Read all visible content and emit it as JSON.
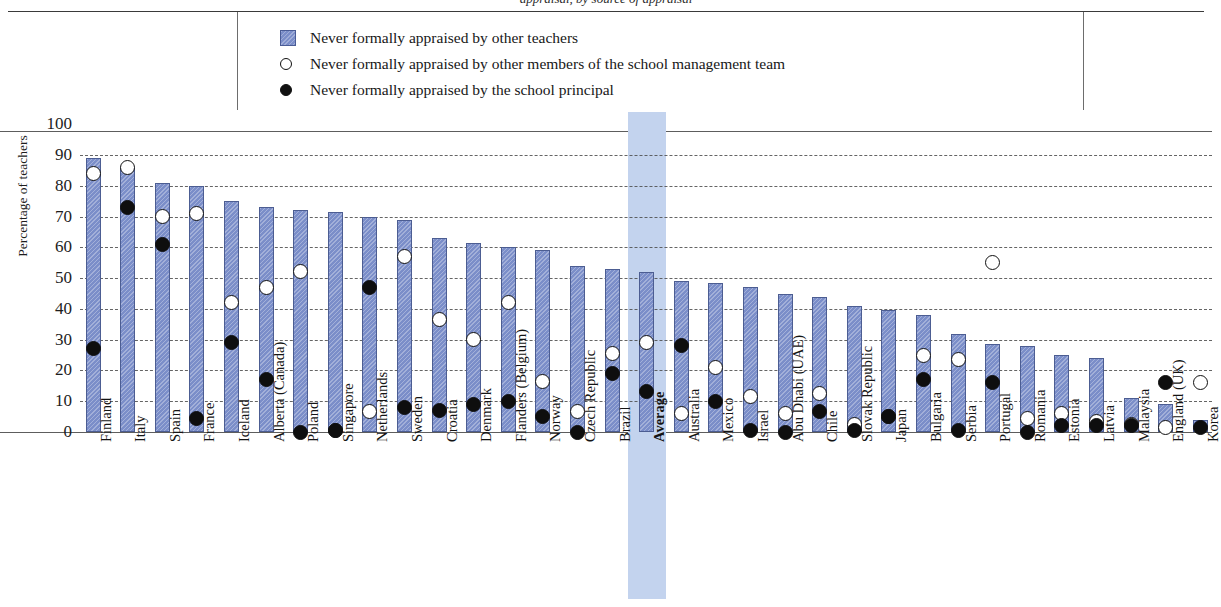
{
  "figure": {
    "partial_title_fragment": "appraisal, by source of appraisal",
    "y_axis_label": "Percentage of teachers",
    "highlight_category": "Average"
  },
  "legend": {
    "position": "top-center",
    "items": [
      {
        "marker": "bar-swatch-icon",
        "label": "Never formally appraised by other teachers"
      },
      {
        "marker": "open-circle-icon",
        "label": "Never formally appraised by other members of the school management team"
      },
      {
        "marker": "filled-circle-icon",
        "label": "Never formally appraised by the school principal"
      }
    ]
  },
  "colors": {
    "bar": "#7b8ec9",
    "bar_border": "#4c5d92",
    "highlight_band": "#c3d3ee",
    "marker_open_fill": "#ffffff",
    "marker_filled_fill": "#0e0e0e",
    "grid": "#4b4b4b",
    "axis": "#5d5d5d"
  },
  "chart_data": {
    "type": "bar",
    "title": "",
    "xlabel": "",
    "ylabel": "Percentage of teachers",
    "ylim": [
      0,
      100
    ],
    "yticks": [
      0,
      10,
      20,
      30,
      40,
      50,
      60,
      70,
      80,
      90,
      100
    ],
    "grid": true,
    "legend_position": "top",
    "categories": [
      "Finland",
      "Italy",
      "Spain",
      "France",
      "Iceland",
      "Alberta (Canada)",
      "Poland",
      "Singapore",
      "Netherlands",
      "Sweden",
      "Croatia",
      "Denmark",
      "Flanders (Belgium)",
      "Norway",
      "Czech Republic",
      "Brazil",
      "Average",
      "Australia",
      "Mexico",
      "Israel",
      "Abu Dhabi (UAE)",
      "Chile",
      "Slovak Republic",
      "Japan",
      "Bulgaria",
      "Serbia",
      "Portugal",
      "Romania",
      "Estonia",
      "Latvia",
      "Malaysia",
      "England (UK)",
      "Korea"
    ],
    "series": [
      {
        "name": "Never formally appraised by other teachers",
        "type": "bar",
        "values": [
          89,
          86,
          81,
          80,
          75,
          73,
          72,
          71.5,
          70,
          69,
          63,
          61.5,
          60,
          59,
          54,
          53,
          52,
          49,
          48.5,
          47,
          45,
          44,
          41,
          39.5,
          38,
          32,
          28.5,
          28,
          25,
          24,
          11,
          9,
          4
        ]
      },
      {
        "name": "Never formally appraised by other members of the school management team",
        "type": "marker-open",
        "values": [
          84,
          86,
          70,
          71,
          42,
          47,
          52,
          0.5,
          6.5,
          57,
          36.5,
          30,
          42,
          16.5,
          6.5,
          25.5,
          29,
          6,
          21,
          11.5,
          6,
          12.5,
          2.5,
          5,
          25,
          23.5,
          55,
          4.5,
          6,
          3.5,
          2.5,
          1.5,
          16
        ]
      },
      {
        "name": "Never formally appraised by the school principal",
        "type": "marker-filled",
        "values": [
          27,
          73,
          61,
          4.5,
          29,
          17,
          0,
          0.5,
          47,
          8,
          7,
          9,
          10,
          5,
          0,
          19,
          13,
          28,
          10,
          0.5,
          0,
          6.5,
          0.5,
          5,
          17,
          0.5,
          16,
          0,
          2,
          2,
          2,
          16,
          1.5
        ]
      }
    ]
  }
}
